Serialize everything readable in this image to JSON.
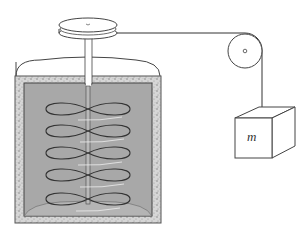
{
  "diagram": {
    "labels": {
      "mass": "m"
    },
    "components": [
      {
        "name": "top-pulley",
        "description": "horizontal grooved pulley on top of shaft"
      },
      {
        "name": "shaft",
        "description": "vertical rotating shaft"
      },
      {
        "name": "container",
        "description": "insulated vessel filled with water"
      },
      {
        "name": "paddles",
        "count": 5
      },
      {
        "name": "side-pulley",
        "description": "fixed pulley guiding the string"
      },
      {
        "name": "string",
        "description": "cord from top pulley over side pulley to mass"
      },
      {
        "name": "hanging-mass",
        "label": "m"
      }
    ],
    "colors": {
      "water": "#a9a9a9",
      "insulation": "#cfcfcf",
      "line": "#333333",
      "background": "#ffffff"
    }
  }
}
